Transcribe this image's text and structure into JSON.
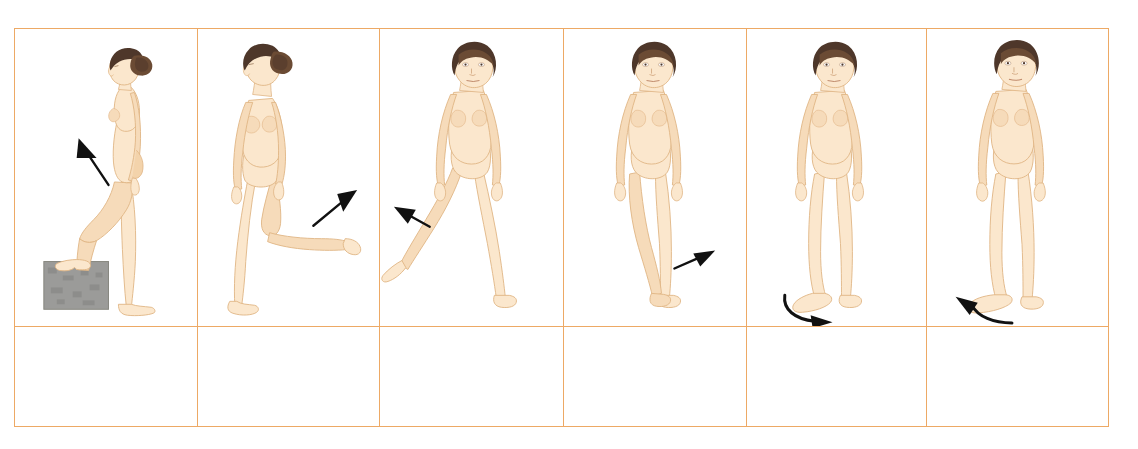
{
  "figure": {
    "kind": "anatomical-illustration-grid",
    "columns": 6,
    "rows": 2,
    "caption_row_empty": true
  },
  "colors": {
    "table_border": "#eda965",
    "skin_fill": "#fbe7cd",
    "skin_shade": "#f3d3ab",
    "skin_shade_deep": "#e8bd8d",
    "skin_outline": "#e0b584",
    "hair_dark": "#4e372a",
    "hair_mid": "#6b4b34",
    "hair_light": "#8a6546",
    "arrow_black": "#111111",
    "block_gray": "#9b9b99",
    "block_gray_dark": "#7e7e7c",
    "background": "#ffffff"
  },
  "panels": [
    {
      "id": "panel-1",
      "name": "hip-flexion",
      "view": "lateral-side-view",
      "figure_pose": "standing in profile facing left with left foot raised onto a gray step block, hip and knee flexed",
      "props": [
        "gray-step-block"
      ],
      "arrow": {
        "type": "straight",
        "direction": "up-left",
        "icon": "arrow-up-left-icon",
        "color": "#111111"
      },
      "caption": ""
    },
    {
      "id": "panel-2",
      "name": "hip-extension",
      "view": "three-quarter-view",
      "figure_pose": "standing three-quarter view with the right leg lifted and bent backward behind the body",
      "props": [],
      "arrow": {
        "type": "straight",
        "direction": "up-right",
        "icon": "arrow-up-right-icon",
        "color": "#111111"
      },
      "caption": ""
    },
    {
      "id": "panel-3",
      "name": "hip-abduction",
      "view": "anterior-front-view",
      "figure_pose": "standing front view with the right leg extended outward away from the midline",
      "props": [],
      "arrow": {
        "type": "straight",
        "direction": "up-left",
        "icon": "arrow-up-left-icon",
        "color": "#111111"
      },
      "caption": ""
    },
    {
      "id": "panel-4",
      "name": "hip-adduction",
      "view": "anterior-front-view",
      "figure_pose": "standing front view with the right leg crossed over the midline in front of the left leg",
      "props": [],
      "arrow": {
        "type": "straight",
        "direction": "up-right",
        "icon": "arrow-up-right-icon",
        "color": "#111111"
      },
      "caption": ""
    },
    {
      "id": "panel-5",
      "name": "hip-medial-rotation",
      "view": "anterior-front-view",
      "figure_pose": "standing front view, weight on both feet, right foot rotating inward",
      "props": [],
      "arrow": {
        "type": "curved",
        "direction": "clockwise-right",
        "icon": "arrow-curved-right-icon",
        "color": "#111111"
      },
      "caption": ""
    },
    {
      "id": "panel-6",
      "name": "hip-lateral-rotation",
      "view": "anterior-front-view",
      "figure_pose": "standing front view, weight on both feet, right foot rotating outward",
      "props": [],
      "arrow": {
        "type": "curved",
        "direction": "counterclockwise-left",
        "icon": "arrow-curved-left-icon",
        "color": "#111111"
      },
      "caption": ""
    }
  ]
}
